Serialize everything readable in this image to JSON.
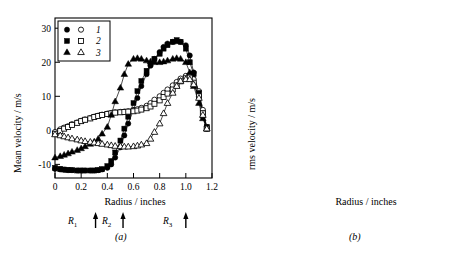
{
  "figure": {
    "panels": [
      "a",
      "b"
    ],
    "caption_a": "(a)",
    "caption_b": "(b)"
  },
  "panelA": {
    "caption": "(a)",
    "ylabel": "Mean velocity / m/s",
    "xlabel": "Radius / inches",
    "xticks": [
      "0",
      "0.2",
      "0.4",
      "0.6",
      "0.8",
      "1.0",
      "1.2"
    ],
    "yticks": [
      "-10",
      "0",
      "10",
      "20",
      "30"
    ],
    "legend": [
      {
        "label": "1",
        "filled": "circle",
        "open": "circle"
      },
      {
        "label": "2",
        "filled": "square",
        "open": "square"
      },
      {
        "label": "3",
        "filled": "triangle",
        "open": "triangle"
      }
    ],
    "radial_markers": [
      {
        "label": "R",
        "sub": "1",
        "x": 0.31
      },
      {
        "label": "R",
        "sub": "2",
        "x": 0.52
      },
      {
        "label": "R",
        "sub": "3",
        "x": 1.0
      }
    ]
  },
  "panelB": {
    "caption": "(b)",
    "ylabel": "rms velocity / m/s",
    "xlabel": "Radius / inches",
    "xticks": [
      "0",
      "0.2",
      "0.4",
      "0.6",
      "0.8",
      "1.0",
      "1.2"
    ],
    "yticks": [
      "5",
      "10",
      "15"
    ],
    "legend": [
      {
        "label": "1",
        "filled": "circle",
        "open": "circle"
      },
      {
        "label": "2",
        "filled": "square",
        "open": "square"
      },
      {
        "label": "3",
        "filled": "triangle",
        "open": "triangle"
      }
    ]
  },
  "chart_data": [
    {
      "type": "scatter",
      "panel": "a",
      "title": "",
      "xlabel": "Radius / inches",
      "ylabel": "Mean velocity / m/s",
      "xlim": [
        0,
        1.2
      ],
      "ylim": [
        -14,
        33
      ],
      "xticks": [
        0,
        0.2,
        0.4,
        0.6,
        0.8,
        1.0,
        1.2
      ],
      "yticks": [
        -10,
        0,
        10,
        20,
        30
      ],
      "grid": false,
      "legend_position": "top-left",
      "annotations": [
        {
          "text": "R1",
          "x": 0.31,
          "type": "arrow-below-axis"
        },
        {
          "text": "R2",
          "x": 0.52,
          "type": "arrow-below-axis"
        },
        {
          "text": "R3",
          "x": 1.0,
          "type": "arrow-below-axis"
        }
      ],
      "series": [
        {
          "name": "1 filled",
          "marker": "circle-filled",
          "x": [
            0.0,
            0.04,
            0.07,
            0.1,
            0.13,
            0.17,
            0.2,
            0.23,
            0.27,
            0.3,
            0.33,
            0.36,
            0.4,
            0.43,
            0.46,
            0.5,
            0.53,
            0.56,
            0.6,
            0.63,
            0.66,
            0.7,
            0.73,
            0.76,
            0.8,
            0.83,
            0.86,
            0.9,
            0.93,
            0.96,
            1.0,
            1.03,
            1.06,
            1.1,
            1.13,
            1.16
          ],
          "y": [
            -11.3,
            -11.5,
            -11.6,
            -11.7,
            -11.7,
            -11.8,
            -11.8,
            -11.8,
            -11.8,
            -11.8,
            -11.7,
            -11.5,
            -11.0,
            -10.0,
            -8.0,
            -5.0,
            -1.5,
            2.0,
            6.0,
            9.5,
            13.0,
            16.5,
            19.0,
            21.0,
            23.0,
            24.5,
            25.5,
            26.0,
            26.2,
            26.0,
            25.0,
            22.0,
            17.0,
            10.0,
            4.0,
            0.5
          ]
        },
        {
          "name": "1 open",
          "marker": "circle-open",
          "x": [
            0.0,
            0.04,
            0.07,
            0.1,
            0.13,
            0.17,
            0.2,
            0.23,
            0.27,
            0.3,
            0.33,
            0.36,
            0.4,
            0.43,
            0.46,
            0.5,
            0.53,
            0.56,
            0.6,
            0.63,
            0.66,
            0.7,
            0.73,
            0.76,
            0.8,
            0.83,
            0.86,
            0.9,
            0.93,
            0.96,
            1.0,
            1.03,
            1.06,
            1.1,
            1.13,
            1.16
          ],
          "y": [
            -0.5,
            0.3,
            0.8,
            1.2,
            1.8,
            2.3,
            2.8,
            3.2,
            3.6,
            4.0,
            4.3,
            4.6,
            4.9,
            5.1,
            5.3,
            5.4,
            5.5,
            5.6,
            5.8,
            6.2,
            6.6,
            7.2,
            8.0,
            9.0,
            10.0,
            11.0,
            12.0,
            13.2,
            14.2,
            15.2,
            16.0,
            16.2,
            15.0,
            11.5,
            6.0,
            1.0
          ]
        },
        {
          "name": "2 filled",
          "marker": "square-filled",
          "x": [
            0.0,
            0.04,
            0.07,
            0.1,
            0.13,
            0.17,
            0.2,
            0.23,
            0.27,
            0.3,
            0.33,
            0.36,
            0.4,
            0.43,
            0.46,
            0.5,
            0.53,
            0.56,
            0.6,
            0.63,
            0.66,
            0.7,
            0.73,
            0.76,
            0.8,
            0.83,
            0.86,
            0.9,
            0.93,
            0.96,
            1.0,
            1.03,
            1.06,
            1.1,
            1.13,
            1.16
          ],
          "y": [
            -11.0,
            -11.3,
            -11.5,
            -11.6,
            -11.7,
            -11.8,
            -11.8,
            -11.8,
            -11.8,
            -11.8,
            -11.7,
            -11.4,
            -10.5,
            -9.0,
            -6.5,
            -3.0,
            0.5,
            4.0,
            8.0,
            11.5,
            14.5,
            17.5,
            19.5,
            21.0,
            22.5,
            24.0,
            25.0,
            26.0,
            26.5,
            26.0,
            24.0,
            20.0,
            16.5,
            11.0,
            5.0,
            1.0
          ]
        },
        {
          "name": "2 open",
          "marker": "square-open",
          "x": [
            0.0,
            0.04,
            0.07,
            0.1,
            0.13,
            0.17,
            0.2,
            0.23,
            0.27,
            0.3,
            0.33,
            0.36,
            0.4,
            0.43,
            0.46,
            0.5,
            0.53,
            0.56,
            0.6,
            0.63,
            0.66,
            0.7,
            0.73,
            0.76,
            0.8,
            0.83,
            0.86,
            0.9,
            0.93,
            0.96,
            1.0,
            1.03,
            1.06,
            1.1,
            1.13,
            1.16
          ],
          "y": [
            -1.0,
            -0.2,
            0.5,
            1.0,
            1.6,
            2.2,
            2.7,
            3.1,
            3.5,
            3.9,
            4.2,
            4.5,
            4.8,
            5.0,
            5.2,
            5.3,
            5.4,
            5.5,
            5.6,
            5.8,
            6.1,
            6.5,
            7.0,
            7.8,
            8.8,
            9.8,
            10.8,
            12.0,
            13.2,
            14.4,
            15.3,
            15.5,
            14.0,
            10.0,
            5.0,
            0.5
          ]
        },
        {
          "name": "3 filled",
          "marker": "triangle-filled",
          "x": [
            0.0,
            0.04,
            0.07,
            0.1,
            0.13,
            0.17,
            0.2,
            0.23,
            0.27,
            0.3,
            0.33,
            0.36,
            0.4,
            0.43,
            0.46,
            0.5,
            0.53,
            0.56,
            0.6,
            0.63,
            0.66,
            0.7,
            0.73,
            0.76,
            0.8,
            0.83,
            0.86,
            0.9,
            0.93,
            0.96,
            1.0,
            1.03,
            1.06,
            1.1,
            1.13,
            1.16
          ],
          "y": [
            -8.0,
            -7.6,
            -7.2,
            -6.8,
            -6.3,
            -5.8,
            -5.3,
            -4.7,
            -4.0,
            -3.3,
            -2.5,
            -1.0,
            1.0,
            4.5,
            8.5,
            12.5,
            16.5,
            19.5,
            21.0,
            21.2,
            21.0,
            20.5,
            20.2,
            20.0,
            20.0,
            20.2,
            20.5,
            21.0,
            21.2,
            21.0,
            20.0,
            17.0,
            13.0,
            8.0,
            3.5,
            0.5
          ]
        },
        {
          "name": "3 open",
          "marker": "triangle-open",
          "x": [
            0.0,
            0.04,
            0.07,
            0.1,
            0.13,
            0.17,
            0.2,
            0.23,
            0.27,
            0.3,
            0.33,
            0.36,
            0.4,
            0.43,
            0.46,
            0.5,
            0.53,
            0.56,
            0.6,
            0.63,
            0.66,
            0.7,
            0.73,
            0.76,
            0.8,
            0.83,
            0.86,
            0.9,
            0.93,
            0.96,
            1.0,
            1.03,
            1.06,
            1.1,
            1.13,
            1.16
          ],
          "y": [
            -1.2,
            -1.5,
            -1.8,
            -2.1,
            -2.4,
            -2.7,
            -3.0,
            -3.2,
            -3.4,
            -3.6,
            -3.8,
            -4.0,
            -4.2,
            -4.4,
            -4.6,
            -4.7,
            -4.8,
            -4.8,
            -4.7,
            -4.5,
            -4.2,
            -3.8,
            -2.5,
            -0.5,
            2.0,
            5.0,
            8.0,
            11.0,
            13.0,
            14.5,
            15.0,
            15.0,
            13.5,
            9.5,
            4.5,
            0.5
          ]
        }
      ]
    },
    {
      "type": "scatter",
      "panel": "b",
      "title": "",
      "xlabel": "Radius / inches",
      "ylabel": "rms velocity / m/s",
      "xlim": [
        0,
        1.2
      ],
      "ylim": [
        3.2,
        18.2
      ],
      "xticks": [
        0,
        0.2,
        0.4,
        0.6,
        0.8,
        1.0,
        1.2
      ],
      "yticks": [
        5,
        10,
        15
      ],
      "grid": false,
      "legend_position": "top-right",
      "series": [
        {
          "name": "1 filled",
          "marker": "circle-filled",
          "x": [
            0.0,
            0.04,
            0.07,
            0.1,
            0.13,
            0.17,
            0.2,
            0.23,
            0.27,
            0.3,
            0.33,
            0.36,
            0.4,
            0.43,
            0.46,
            0.5,
            0.53,
            0.56,
            0.6,
            0.63,
            0.66,
            0.7,
            0.73,
            0.76,
            0.8,
            0.83,
            0.86,
            0.9,
            0.93,
            0.96,
            1.0,
            1.03,
            1.06,
            1.1,
            1.13,
            1.16
          ],
          "y": [
            5.2,
            5.1,
            5.1,
            5.1,
            5.1,
            5.2,
            5.2,
            5.3,
            5.4,
            5.5,
            5.8,
            6.2,
            7.0,
            8.0,
            9.5,
            11.5,
            13.5,
            15.5,
            17.0,
            16.8,
            16.0,
            15.0,
            14.2,
            13.6,
            13.0,
            12.6,
            12.2,
            11.8,
            11.4,
            11.0,
            10.2,
            9.5,
            8.8,
            8.0,
            7.2,
            6.7
          ]
        },
        {
          "name": "1 open",
          "marker": "circle-open",
          "x": [
            0.0,
            0.04,
            0.07,
            0.1,
            0.13,
            0.17,
            0.2,
            0.23,
            0.27,
            0.3,
            0.33,
            0.36,
            0.4,
            0.43,
            0.46,
            0.5,
            0.53,
            0.56,
            0.6,
            0.63,
            0.66,
            0.7,
            0.73,
            0.76,
            0.8,
            0.83,
            0.86,
            0.9,
            0.93,
            0.96,
            1.0,
            1.03,
            1.06,
            1.1,
            1.13,
            1.16
          ],
          "y": [
            4.6,
            4.5,
            4.5,
            4.5,
            4.5,
            4.5,
            4.6,
            4.6,
            4.7,
            4.8,
            5.0,
            5.3,
            5.8,
            6.5,
            7.3,
            8.2,
            9.0,
            9.6,
            10.0,
            10.2,
            10.2,
            10.1,
            10.0,
            9.8,
            9.6,
            9.5,
            9.4,
            9.2,
            9.0,
            8.7,
            8.2,
            7.7,
            7.1,
            6.5,
            6.0,
            5.6
          ]
        },
        {
          "name": "2 filled",
          "marker": "square-filled",
          "x": [
            0.0,
            0.04,
            0.07,
            0.1,
            0.13,
            0.17,
            0.2,
            0.23,
            0.27,
            0.3,
            0.33,
            0.36,
            0.4,
            0.43,
            0.46,
            0.5,
            0.53,
            0.56,
            0.6,
            0.63,
            0.66,
            0.7,
            0.73,
            0.76,
            0.8,
            0.83,
            0.86,
            0.9,
            0.93,
            0.96,
            1.0,
            1.03,
            1.06,
            1.1,
            1.13,
            1.16
          ],
          "y": [
            5.1,
            5.0,
            5.0,
            5.0,
            5.0,
            5.1,
            5.1,
            5.2,
            5.3,
            5.4,
            5.7,
            6.1,
            6.8,
            7.7,
            9.0,
            10.8,
            12.5,
            13.8,
            14.7,
            15.0,
            14.8,
            14.2,
            13.6,
            13.2,
            12.8,
            12.5,
            12.2,
            11.9,
            11.6,
            11.2,
            10.5,
            9.8,
            9.0,
            8.2,
            7.4,
            6.8
          ]
        },
        {
          "name": "2 open",
          "marker": "square-open",
          "x": [
            0.0,
            0.04,
            0.07,
            0.1,
            0.13,
            0.17,
            0.2,
            0.23,
            0.27,
            0.3,
            0.33,
            0.36,
            0.4,
            0.43,
            0.46,
            0.5,
            0.53,
            0.56,
            0.6,
            0.63,
            0.66,
            0.7,
            0.73,
            0.76,
            0.8,
            0.83,
            0.86,
            0.9,
            0.93,
            0.96,
            1.0,
            1.03,
            1.06,
            1.1,
            1.13,
            1.16
          ],
          "y": [
            4.3,
            4.2,
            4.2,
            4.2,
            4.2,
            4.2,
            4.3,
            4.3,
            4.4,
            4.5,
            4.7,
            5.0,
            5.4,
            6.0,
            6.7,
            7.4,
            8.1,
            8.7,
            9.2,
            9.6,
            9.8,
            9.9,
            9.9,
            9.8,
            9.7,
            9.6,
            9.5,
            9.3,
            9.0,
            8.6,
            8.0,
            7.4,
            6.8,
            6.2,
            5.8,
            5.5
          ]
        },
        {
          "name": "3 filled",
          "marker": "triangle-filled",
          "x": [
            0.0,
            0.04,
            0.07,
            0.1,
            0.13,
            0.17,
            0.2,
            0.23,
            0.27,
            0.3,
            0.33,
            0.36,
            0.4,
            0.43,
            0.46,
            0.5,
            0.53,
            0.56,
            0.6,
            0.63,
            0.66,
            0.7,
            0.73,
            0.76,
            0.8,
            0.83,
            0.86,
            0.9,
            0.93,
            0.96,
            1.0,
            1.03,
            1.06,
            1.1,
            1.13,
            1.16
          ],
          "y": [
            9.3,
            9.8,
            10.0,
            10.0,
            9.9,
            9.8,
            9.7,
            9.7,
            9.8,
            10.0,
            10.4,
            11.0,
            12.0,
            13.6,
            15.2,
            16.5,
            17.0,
            16.8,
            16.2,
            15.4,
            14.6,
            13.8,
            13.2,
            12.8,
            12.4,
            12.2,
            12.0,
            11.8,
            11.5,
            11.0,
            10.3,
            9.4,
            8.5,
            7.7,
            7.0,
            6.6
          ]
        },
        {
          "name": "3 open",
          "marker": "triangle-open",
          "x": [
            0.0,
            0.04,
            0.07,
            0.1,
            0.13,
            0.17,
            0.2,
            0.23,
            0.27,
            0.3,
            0.33,
            0.36,
            0.4,
            0.43,
            0.46,
            0.5,
            0.53,
            0.56,
            0.6,
            0.63,
            0.66,
            0.7,
            0.73,
            0.76,
            0.8,
            0.83,
            0.86,
            0.9,
            0.93,
            0.96,
            1.0,
            1.03,
            1.06,
            1.1,
            1.13,
            1.16
          ],
          "y": [
            7.3,
            7.6,
            7.8,
            7.9,
            8.0,
            8.1,
            8.2,
            8.4,
            8.6,
            8.8,
            9.1,
            9.4,
            9.8,
            10.3,
            10.7,
            11.1,
            11.3,
            11.4,
            11.4,
            11.4,
            11.4,
            11.5,
            11.5,
            11.5,
            11.5,
            11.4,
            11.2,
            11.0,
            10.6,
            10.0,
            9.3,
            8.5,
            7.6,
            6.7,
            5.9,
            5.3
          ]
        }
      ]
    }
  ]
}
